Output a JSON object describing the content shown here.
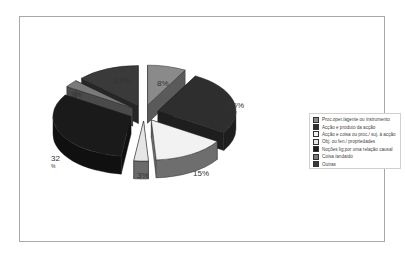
{
  "chart_data": {
    "type": "pie",
    "style": "3d-exploded",
    "title": "",
    "legend_position": "right",
    "slices": [
      {
        "label": "Proc.oper./agente ou instrumento",
        "value": 8,
        "display": "8%",
        "top_color": "#8a8a8a",
        "side_color": "#5a5a5a"
      },
      {
        "label": "Acção e produto da acção",
        "value": 26,
        "display": "26%",
        "top_color": "#2e2e2e",
        "side_color": "#1e1e1e"
      },
      {
        "label": "Acção e coisa ou proc./ suj. à acção",
        "value": 15,
        "display": "15%",
        "top_color": "#f2f2f2",
        "side_color": "#6e6e6e"
      },
      {
        "label": "Obj. ou fen./ propriedades",
        "value": 3,
        "display": "3%",
        "top_color": "#e6e6e6",
        "side_color": "#6a6a6a"
      },
      {
        "label": "Noções lig.por uma relação causal",
        "value": 32,
        "display": "32 %",
        "top_color": "#1a1a1a",
        "side_color": "#101010"
      },
      {
        "label": "Coisa /andaído",
        "value": 3,
        "display": "3%",
        "top_color": "#7a7a7a",
        "side_color": "#4a4a4a"
      },
      {
        "label": "Outras",
        "value": 13,
        "display": "13%",
        "top_color": "#3a3a3a",
        "side_color": "#262626"
      }
    ]
  }
}
